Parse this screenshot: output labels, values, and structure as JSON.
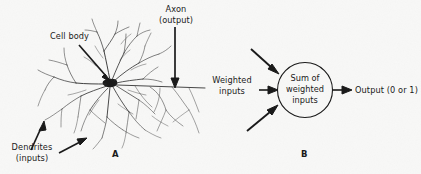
{
  "figure": {
    "width": 421,
    "height": 174,
    "background_color": "#f8f8f7",
    "ink_color": "#1a1a1a"
  },
  "panel_a": {
    "letter": "A",
    "labels": {
      "cell_body": "Cell body",
      "axon_line1": "Axon",
      "axon_line2": "(output)",
      "dendrites_line1": "Dendrites",
      "dendrites_line2": "(inputs)"
    }
  },
  "panel_b": {
    "letter": "B",
    "labels": {
      "weighted_inputs_line1": "Weighted",
      "weighted_inputs_line2": "inputs",
      "node_line1": "Sum of",
      "node_line2": "weighted",
      "node_line3": "inputs",
      "output": "Output (0 or 1)"
    }
  }
}
